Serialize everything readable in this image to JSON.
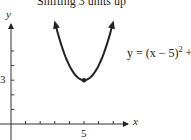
{
  "chart_data": {
    "type": "line",
    "title": "Shifting 3 units up",
    "xlabel": "x",
    "ylabel": "y",
    "equation_label": "y = (x − 5)² + 3",
    "function": "y = (x - 5)^2 + 3",
    "vertex": {
      "x": 5,
      "y": 3
    },
    "x_tick_labels": [
      "5"
    ],
    "y_tick_labels": [
      "3"
    ],
    "x_ticks": [
      1,
      2,
      3,
      4,
      5,
      6,
      7
    ],
    "y_ticks": [
      1,
      2,
      3,
      4,
      5
    ],
    "xlim": [
      -0.3,
      8.2
    ],
    "ylim": [
      -0.5,
      7
    ],
    "x": [
      3,
      3.5,
      4,
      4.5,
      5,
      5.5,
      6,
      6.5,
      7
    ],
    "series": [
      {
        "name": "y = (x − 5)² + 3",
        "values": [
          7,
          5.25,
          4,
          3.25,
          3,
          3.25,
          4,
          5.25,
          7
        ]
      }
    ],
    "grid": false,
    "legend": "none"
  },
  "labels": {
    "title": "Shifting 3 units up",
    "y_axis": "y",
    "x_axis": "x",
    "tick_y_3": "3",
    "tick_x_5": "5",
    "eq_prefix": "y = (x − 5)",
    "eq_exp": "2",
    "eq_suffix": " + 3"
  }
}
